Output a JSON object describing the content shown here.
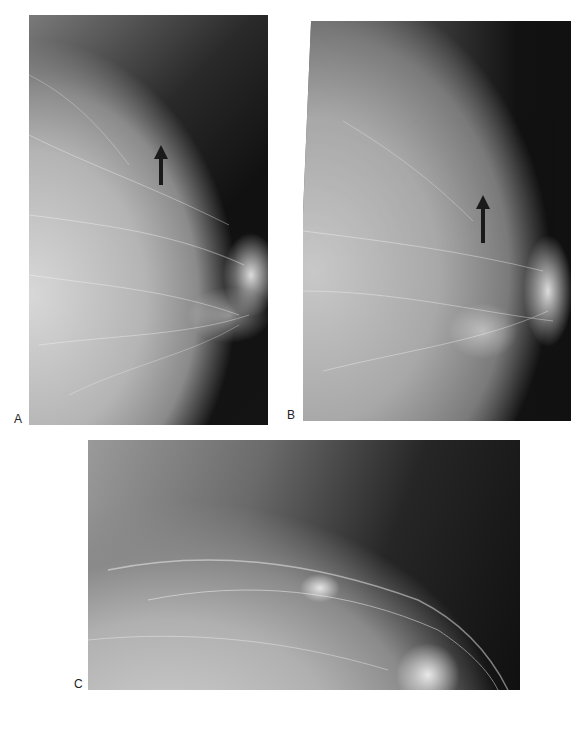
{
  "figure": {
    "panels": [
      {
        "id": "A",
        "label": "A",
        "description": "Mammogram, view 1, arrow indicating lesion"
      },
      {
        "id": "B",
        "label": "B",
        "description": "Mammogram, view 2, arrow indicating lesion"
      },
      {
        "id": "C",
        "label": "C",
        "description": "Magnified mammogram view showing lesion"
      }
    ],
    "caption_fragment": ""
  }
}
